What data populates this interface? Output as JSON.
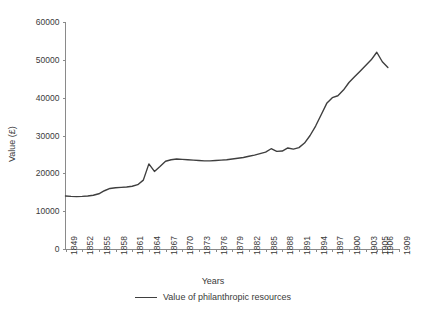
{
  "chart_data": {
    "type": "line",
    "title": "",
    "xlabel": "Years",
    "ylabel": "Value (£)",
    "ylim": [
      0,
      60000
    ],
    "yticks": [
      0,
      10000,
      20000,
      30000,
      40000,
      50000,
      60000
    ],
    "ytick_labels": [
      "0",
      "10000",
      "20000",
      "30000",
      "40000",
      "50000",
      "60000"
    ],
    "xtick_labels": [
      "1849",
      "1852",
      "1855",
      "1858",
      "1861",
      "1864",
      "1867",
      "1870",
      "1873",
      "1876",
      "1879",
      "1882",
      "1885",
      "1888",
      "1891",
      "1894",
      "1897",
      "1900",
      "1903",
      "1905",
      "1906",
      "1909"
    ],
    "xlim": [
      1849,
      1909
    ],
    "grid": false,
    "legend_position": "bottom",
    "series": [
      {
        "name": "Value of philanthropic resources",
        "color": "#3f3f3f",
        "x": [
          1849,
          1850,
          1851,
          1852,
          1853,
          1854,
          1855,
          1856,
          1857,
          1858,
          1859,
          1860,
          1861,
          1862,
          1863,
          1864,
          1865,
          1866,
          1867,
          1868,
          1869,
          1870,
          1871,
          1872,
          1873,
          1874,
          1875,
          1876,
          1877,
          1878,
          1879,
          1880,
          1881,
          1882,
          1883,
          1884,
          1885,
          1886,
          1887,
          1888,
          1889,
          1890,
          1891,
          1892,
          1893,
          1894,
          1895,
          1896,
          1897,
          1898,
          1899,
          1900,
          1901,
          1902,
          1903,
          1904,
          1905,
          1906,
          1907
        ],
        "values": [
          14000,
          13900,
          13850,
          13900,
          14000,
          14200,
          14600,
          15400,
          16000,
          16200,
          16300,
          16400,
          16600,
          17000,
          18200,
          22500,
          20500,
          21800,
          23200,
          23600,
          23800,
          23700,
          23600,
          23500,
          23400,
          23300,
          23300,
          23400,
          23500,
          23600,
          23800,
          24000,
          24200,
          24500,
          24800,
          25200,
          25600,
          26500,
          25800,
          25900,
          26700,
          26400,
          26800,
          28000,
          30000,
          32500,
          35500,
          38500,
          40000,
          40500,
          42000,
          44000,
          45500,
          47000,
          48500,
          50000,
          52000,
          49500,
          48000
        ]
      }
    ]
  },
  "legend": {
    "label": "Value of philanthropic resources"
  },
  "axes": {
    "x_title": "Years",
    "y_title": "Value (£)"
  }
}
